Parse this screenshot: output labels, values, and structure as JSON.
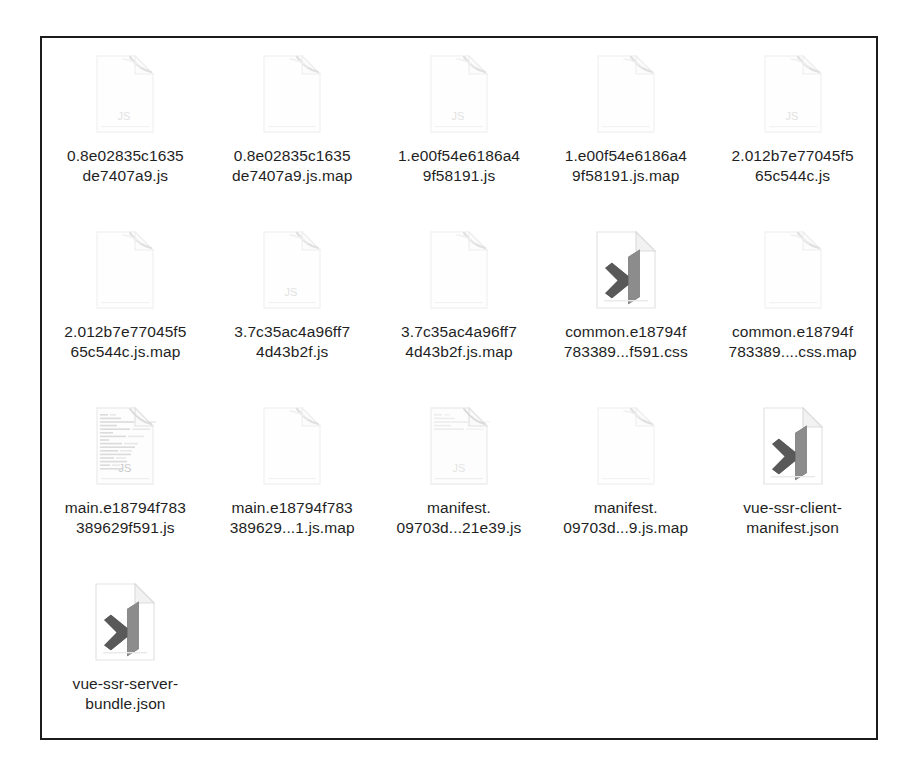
{
  "window": {
    "title": "File Explorer — Large Icons View",
    "background_color": "#ffffff",
    "border_color": "#1c1c1c"
  },
  "grid": {
    "columns": 5,
    "rows": 4,
    "total_items": 16,
    "view_mode": "large-icons"
  },
  "files": [
    {
      "name": "0.8e02835c1635de7407a9.js",
      "label_line1": "0.8e02835c1635",
      "label_line2": "de7407a9.js",
      "icon": "js-file-icon",
      "icon_badge": "JS",
      "icon_style": "faint-document",
      "extension": "js"
    },
    {
      "name": "0.8e02835c1635de7407a9.js.map",
      "label_line1": "0.8e02835c1635",
      "label_line2": "de7407a9.js.map",
      "icon": "blank-file-icon",
      "icon_badge": "",
      "icon_style": "faint-document",
      "extension": "map"
    },
    {
      "name": "1.e00f54e6186a49f58191.js",
      "label_line1": "1.e00f54e6186a4",
      "label_line2": "9f58191.js",
      "icon": "js-file-icon",
      "icon_badge": "JS",
      "icon_style": "faint-document",
      "extension": "js"
    },
    {
      "name": "1.e00f54e6186a49f58191.js.map",
      "label_line1": "1.e00f54e6186a4",
      "label_line2": "9f58191.js.map",
      "icon": "blank-file-icon",
      "icon_badge": "",
      "icon_style": "faint-document",
      "extension": "map"
    },
    {
      "name": "2.012b7e77045f565c544c.js",
      "label_line1": "2.012b7e77045f5",
      "label_line2": "65c544c.js",
      "icon": "js-file-icon",
      "icon_badge": "JS",
      "icon_style": "faint-document",
      "extension": "js"
    },
    {
      "name": "2.012b7e77045f565c544c.js.map",
      "label_line1": "2.012b7e77045f5",
      "label_line2": "65c544c.js.map",
      "icon": "blank-file-icon",
      "icon_badge": "",
      "icon_style": "faint-document",
      "extension": "map"
    },
    {
      "name": "3.7c35ac4a96ff74d43b2f.js",
      "label_line1": "3.7c35ac4a96ff7",
      "label_line2": "4d43b2f.js",
      "icon": "js-file-icon",
      "icon_badge": "JS",
      "icon_style": "faint-document",
      "extension": "js"
    },
    {
      "name": "3.7c35ac4a96ff74d43b2f.js.map",
      "label_line1": "3.7c35ac4a96ff7",
      "label_line2": "4d43b2f.js.map",
      "icon": "blank-file-icon",
      "icon_badge": "",
      "icon_style": "faint-document",
      "extension": "map"
    },
    {
      "name": "common.e18794f783389...f591.css",
      "label_line1": "common.e18794f",
      "label_line2": "783389...f591.css",
      "icon": "vscode-file-icon",
      "icon_badge": "",
      "icon_style": "vscode-logo",
      "extension": "css"
    },
    {
      "name": "common.e18794f783389....css.map",
      "label_line1": "common.e18794f",
      "label_line2": "783389....css.map",
      "icon": "blank-file-icon",
      "icon_badge": "",
      "icon_style": "faint-document",
      "extension": "map"
    },
    {
      "name": "main.e18794f783389629f591.js",
      "label_line1": "main.e18794f783",
      "label_line2": "389629f591.js",
      "icon": "js-file-thumbnail-icon",
      "icon_badge": "JS",
      "icon_style": "thumbnail-preview",
      "extension": "js"
    },
    {
      "name": "main.e18794f783389629...1.js.map",
      "label_line1": "main.e18794f783",
      "label_line2": "389629...1.js.map",
      "icon": "blank-file-icon",
      "icon_badge": "",
      "icon_style": "faint-document",
      "extension": "map"
    },
    {
      "name": "manifest.09703d...21e39.js",
      "label_line1": "manifest.",
      "label_line2": "09703d...21e39.js",
      "icon": "js-file-thumbnail-icon",
      "icon_badge": "JS",
      "icon_style": "thumbnail-preview-light",
      "extension": "js"
    },
    {
      "name": "manifest.09703d...9.js.map",
      "label_line1": "manifest.",
      "label_line2": "09703d...9.js.map",
      "icon": "blank-file-icon",
      "icon_badge": "",
      "icon_style": "faint-document",
      "extension": "map"
    },
    {
      "name": "vue-ssr-client-manifest.json",
      "label_line1": "vue-ssr-client-",
      "label_line2": "manifest.json",
      "icon": "vscode-file-icon",
      "icon_badge": "",
      "icon_style": "vscode-logo",
      "extension": "json"
    },
    {
      "name": "vue-ssr-server-bundle.json",
      "label_line1": "vue-ssr-server-",
      "label_line2": "bundle.json",
      "icon": "vscode-file-icon",
      "icon_badge": "",
      "icon_style": "vscode-logo",
      "extension": "json"
    }
  ],
  "colors": {
    "text": "#1f1f1f",
    "icon_faint_outline": "#f0f0f0",
    "icon_faint_fill": "#fdfdfd",
    "vscode_logo_dark": "#6e6e6e",
    "vscode_logo_mid": "#9a9a9a",
    "border": "#1c1c1c",
    "background": "#ffffff"
  }
}
